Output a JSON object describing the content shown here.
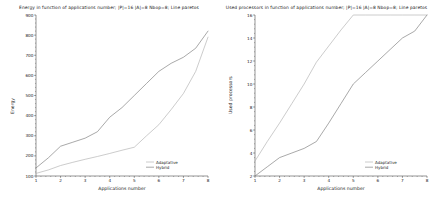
{
  "page": {
    "background_color": "#ffffff",
    "width": 435,
    "height": 204
  },
  "colors": {
    "axis": "#4d4d4d",
    "text": "#1a1a1a",
    "adaptative": "#b0b0b0",
    "hybrid": "#7a7a7a"
  },
  "left_chart": {
    "title": "Energy in function of applications number; |P|=16 |A|=8 Nbop=8; Line paretos",
    "xlabel": "Applications number",
    "ylabel": "Energy",
    "legend": {
      "position": "bottom-right",
      "items": [
        {
          "label": "Adaptative",
          "color": "#b0b0b0"
        },
        {
          "label": "Hybrid",
          "color": "#7a7a7a"
        }
      ]
    },
    "yticks": [
      "100",
      "200",
      "300",
      "400",
      "500",
      "600",
      "700",
      "800",
      "900"
    ],
    "xticks": [
      "1",
      "2",
      "3",
      "4",
      "5",
      "6",
      "7",
      "8"
    ]
  },
  "right_chart": {
    "title": "Used processors in function of applications number; |P|=16 |A|=8 Nbop=8; Line paretos",
    "xlabel": "Applications number",
    "ylabel": "Used processors",
    "legend": {
      "position": "bottom-right",
      "items": [
        {
          "label": "Adaptative",
          "color": "#b0b0b0"
        },
        {
          "label": "Hybrid",
          "color": "#7a7a7a"
        }
      ]
    },
    "yticks": [
      "2",
      "4",
      "6",
      "8",
      "10",
      "12",
      "14",
      "16"
    ],
    "xticks": [
      "1",
      "2",
      "3",
      "4",
      "5",
      "6",
      "7",
      "8"
    ]
  },
  "chart_data": [
    {
      "type": "line",
      "title": "Energy in function of applications number; |P|=16 |A|=8 Nbop=8; Line paretos",
      "xlabel": "Applications number",
      "ylabel": "Energy",
      "xlim": [
        1,
        8
      ],
      "ylim": [
        100,
        900
      ],
      "grid": false,
      "legend_position": "bottom-right",
      "x": [
        1,
        1.5,
        2,
        2.5,
        3,
        3.5,
        4,
        4.5,
        5,
        5.5,
        6,
        6.5,
        7,
        7.5,
        8
      ],
      "series": [
        {
          "name": "Adaptative",
          "color": "#b0b0b0",
          "values": [
            113,
            130,
            152,
            168,
            183,
            197,
            212,
            228,
            243,
            300,
            355,
            430,
            510,
            620,
            790
          ]
        },
        {
          "name": "Hybrid",
          "color": "#7a7a7a",
          "values": [
            140,
            190,
            248,
            268,
            288,
            320,
            392,
            440,
            500,
            560,
            620,
            660,
            690,
            735,
            820
          ]
        }
      ]
    },
    {
      "type": "line",
      "title": "Used processors in function of applications number; |P|=16 |A|=8 Nbop=8; Line paretos",
      "xlabel": "Applications number",
      "ylabel": "Used processors",
      "xlim": [
        1,
        8
      ],
      "ylim": [
        2,
        16
      ],
      "grid": false,
      "legend_position": "bottom-right",
      "x": [
        1,
        1.5,
        2,
        2.5,
        3,
        3.5,
        4,
        4.5,
        5,
        5.5,
        6,
        6.5,
        7,
        7.5,
        8
      ],
      "series": [
        {
          "name": "Adaptative",
          "color": "#b0b0b0",
          "values": [
            3.3,
            5.0,
            6.6,
            8.3,
            10.0,
            11.9,
            13.3,
            14.7,
            16.0,
            16.0,
            16.0,
            16.0,
            16.0,
            16.0,
            16.0
          ]
        },
        {
          "name": "Hybrid",
          "color": "#7a7a7a",
          "values": [
            2.0,
            2.8,
            3.6,
            4.0,
            4.4,
            5.0,
            6.6,
            8.3,
            10.0,
            11.0,
            12.0,
            13.0,
            14.0,
            14.6,
            16.0
          ]
        }
      ]
    }
  ]
}
